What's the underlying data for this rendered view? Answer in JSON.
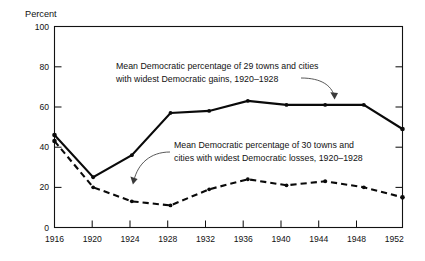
{
  "chart_data": {
    "type": "line",
    "title": "",
    "xlabel": "",
    "ylabel": "Percent",
    "x": [
      1916,
      1920,
      1924,
      1928,
      1932,
      1936,
      1940,
      1944,
      1948,
      1952
    ],
    "xtick_labels": [
      "1916",
      "1920",
      "1924",
      "1928",
      "1932",
      "1936",
      "1940",
      "1944",
      "1948",
      "1952"
    ],
    "ytick_labels": [
      "0",
      "20",
      "40",
      "60",
      "80",
      "100"
    ],
    "yticks": [
      0,
      20,
      40,
      60,
      80,
      100
    ],
    "xlim": [
      1916,
      1952
    ],
    "ylim": [
      0,
      100
    ],
    "grid": false,
    "legend_position": "none",
    "series": [
      {
        "name": "Mean Democratic percentage of 29 towns and cities with widest Democratic gains, 1920-1928",
        "style": "solid",
        "values": [
          46,
          25,
          36,
          57,
          58,
          63,
          61,
          61,
          61,
          49
        ]
      },
      {
        "name": "Mean Democratic percentage of 30 towns and cities with widest Democratic losses, 1920-1928",
        "style": "dashed",
        "values": [
          43,
          20,
          13,
          11,
          19,
          24,
          21,
          23,
          20,
          15
        ]
      }
    ],
    "annotations": [
      {
        "id": "annotation-gains",
        "line1": "Mean Democratic percentage of 29 towns and cities",
        "line2": "with widest Democratic gains, 1920–1928",
        "points_to_year": 1948,
        "points_to_value": 61
      },
      {
        "id": "annotation-losses",
        "line1": "Mean Democratic percentage of 30 towns and",
        "line2": "cities with widest Democratic losses, 1920–1928",
        "points_to_year": 1925,
        "points_to_value": 12
      }
    ],
    "colors": {
      "series": "#0a0a0a",
      "frame": "#121212",
      "background": "#ffffff",
      "leader": "#3a3a3a"
    }
  }
}
